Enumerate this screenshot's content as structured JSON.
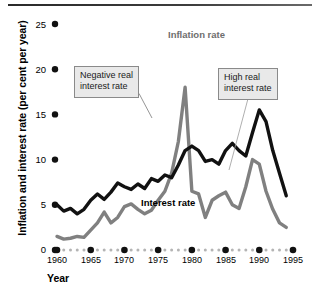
{
  "chart_data": {
    "type": "line",
    "title": "",
    "xlabel": "Year",
    "ylabel": "Inflation and interest rate (per cent per year)",
    "xlim": [
      1960,
      1995
    ],
    "ylim": [
      0,
      26
    ],
    "grid": false,
    "legend_position": "inline-annotations",
    "y_ticks": [
      "0",
      "5",
      "10",
      "15",
      "20",
      "25"
    ],
    "y_tick_values": [
      0,
      5,
      10,
      15,
      20,
      25
    ],
    "x_ticks": [
      "1960",
      "1965",
      "1970",
      "1975",
      "1980",
      "1985",
      "1990",
      "1995"
    ],
    "x_tick_values": [
      1960,
      1965,
      1970,
      1975,
      1980,
      1985,
      1990,
      1995
    ],
    "x": [
      1960,
      1961,
      1962,
      1963,
      1964,
      1965,
      1966,
      1967,
      1968,
      1969,
      1970,
      1971,
      1972,
      1973,
      1974,
      1975,
      1976,
      1977,
      1978,
      1979,
      1980,
      1981,
      1982,
      1983,
      1984,
      1985,
      1986,
      1987,
      1988,
      1989,
      1990,
      1991,
      1992,
      1993,
      1994
    ],
    "series": [
      {
        "name": "Interest rate",
        "color": "#111111",
        "values": [
          5.0,
          4.3,
          4.6,
          4.0,
          4.5,
          5.5,
          6.2,
          5.6,
          6.4,
          7.4,
          7.0,
          6.7,
          7.3,
          6.8,
          7.9,
          7.6,
          8.3,
          8.0,
          9.4,
          11.0,
          13.2,
          11.0,
          12.2,
          14.5,
          10.0,
          8.5,
          11.2,
          14.0,
          16.0,
          17.0,
          14.0,
          16.0,
          13.0,
          12.0,
          11.0
        ],
        "values_late": [
          11.5,
          11.0,
          9.8,
          10.0,
          9.5,
          11.0,
          11.8,
          11.0,
          10.4,
          13.0,
          15.5,
          14.2,
          11.0,
          8.5,
          6.0
        ]
      },
      {
        "name": "Inflation rate",
        "color": "#808080",
        "values": [
          1.5,
          1.2,
          1.3,
          1.5,
          1.4,
          2.2,
          3.0,
          4.2,
          3.0,
          3.6,
          4.8,
          5.1,
          4.5,
          4.0,
          4.4,
          5.5,
          6.5,
          8.5,
          12.0,
          18.0,
          24.5,
          17.0,
          15.8,
          9.0,
          6.6,
          7.5,
          11.5,
          13.5,
          18.5,
          17.2,
          13.5,
          10.2,
          6.2,
          4.2,
          3.8
        ],
        "values_late": [
          6.5,
          6.2,
          3.6,
          5.5,
          6.0,
          6.4,
          5.0,
          4.6,
          7.0,
          10.0,
          9.5,
          6.5,
          4.5,
          3.0,
          2.5
        ]
      }
    ],
    "annotations": [
      {
        "id": "negative-real-interest-rate",
        "line1": "Negative real",
        "line2": "interest rate",
        "box_x": 74,
        "box_y": 66,
        "leader_to_x": 152,
        "leader_to_y": 118
      },
      {
        "id": "high-real-interest-rate",
        "line1": "High real",
        "line2": "interest rate",
        "box_x": 218,
        "box_y": 68,
        "leader_to_x": 229,
        "leader_to_y": 170
      }
    ],
    "series_labels": [
      {
        "id": "inflation-rate-label",
        "text": "Inflation rate",
        "x": 168,
        "y": 35,
        "color": "#6e6e6e"
      },
      {
        "id": "interest-rate-label",
        "text": "Interest rate",
        "x": 141,
        "y": 203,
        "color": "#000000"
      }
    ]
  },
  "axis": {
    "baseline_style": "dotted",
    "major_dot_color": "#111111",
    "minor_dot_color": "#b4b4b4",
    "tick_dot_color": "#111111"
  },
  "figure": {
    "top_rule_color": "#2f2f2f",
    "background": "#ffffff"
  }
}
